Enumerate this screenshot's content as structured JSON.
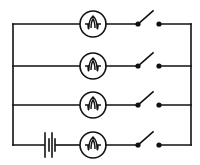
{
  "diagram": {
    "title": "",
    "type": "electric circuit",
    "colors": {
      "line": "#111111",
      "background": "#ffffff"
    },
    "branches": [
      {
        "id": "branch-1",
        "components": [
          "bulb",
          "switch"
        ],
        "switch_state": "open"
      },
      {
        "id": "branch-2",
        "components": [
          "bulb",
          "switch"
        ],
        "switch_state": "open"
      },
      {
        "id": "branch-3",
        "components": [
          "bulb",
          "switch"
        ],
        "switch_state": "open"
      },
      {
        "id": "branch-4",
        "components": [
          "battery",
          "bulb",
          "switch"
        ],
        "switch_state": "open"
      }
    ],
    "icons": {
      "bulb": "lamp-symbol",
      "switch": "open-switch-symbol",
      "battery": "battery-cell-symbol"
    }
  }
}
